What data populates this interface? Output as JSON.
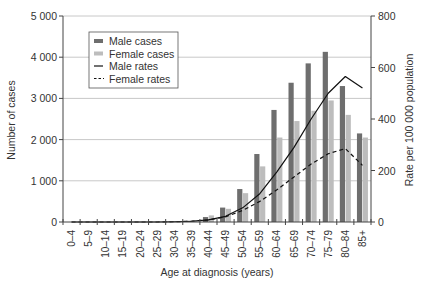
{
  "chart_data": {
    "type": "bar",
    "title": "",
    "xlabel": "Age at diagnosis (years)",
    "ylabel": "Number of cases",
    "y2label": "Rate per 100 000 population",
    "ylim": [
      0,
      5000
    ],
    "y2lim": [
      0,
      800
    ],
    "yticks": [
      "0",
      "1 000",
      "2 000",
      "3 000",
      "4 000",
      "5 000"
    ],
    "y2ticks": [
      "0",
      "200",
      "400",
      "600",
      "800"
    ],
    "grid": true,
    "legend_position": "upper-left",
    "categories": [
      "0–4",
      "5–9",
      "10–14",
      "15–19",
      "20–24",
      "25–29",
      "30–34",
      "35–39",
      "40–44",
      "45–49",
      "50–54",
      "55–59",
      "60–64",
      "65–69",
      "70–74",
      "75–79",
      "80–84",
      "85+"
    ],
    "series": [
      {
        "name": "Male cases",
        "type": "bar",
        "axis": "left",
        "color": "#6e6e6e",
        "values": [
          0,
          0,
          0,
          0,
          0,
          0,
          5,
          30,
          120,
          350,
          800,
          1650,
          2720,
          3380,
          3850,
          4130,
          3300,
          2150
        ]
      },
      {
        "name": "Female cases",
        "type": "bar",
        "axis": "left",
        "color": "#bdbdbd",
        "values": [
          0,
          0,
          0,
          0,
          0,
          0,
          10,
          40,
          160,
          320,
          700,
          1350,
          2050,
          2450,
          2700,
          2950,
          2600,
          2050
        ]
      },
      {
        "name": "Male rates",
        "type": "line",
        "axis": "right",
        "style": "solid",
        "color": "#111111",
        "values": [
          0,
          0,
          0,
          0,
          0,
          0,
          1,
          3,
          8,
          22,
          55,
          110,
          195,
          290,
          400,
          500,
          565,
          520
        ]
      },
      {
        "name": "Female rates",
        "type": "line",
        "axis": "right",
        "style": "dashed",
        "color": "#111111",
        "values": [
          0,
          0,
          0,
          0,
          0,
          0,
          1,
          3,
          8,
          20,
          45,
          80,
          125,
          175,
          225,
          265,
          285,
          220
        ]
      }
    ]
  },
  "legend": {
    "items": [
      "Male cases",
      "Female cases",
      "Male rates",
      "Female rates"
    ]
  }
}
